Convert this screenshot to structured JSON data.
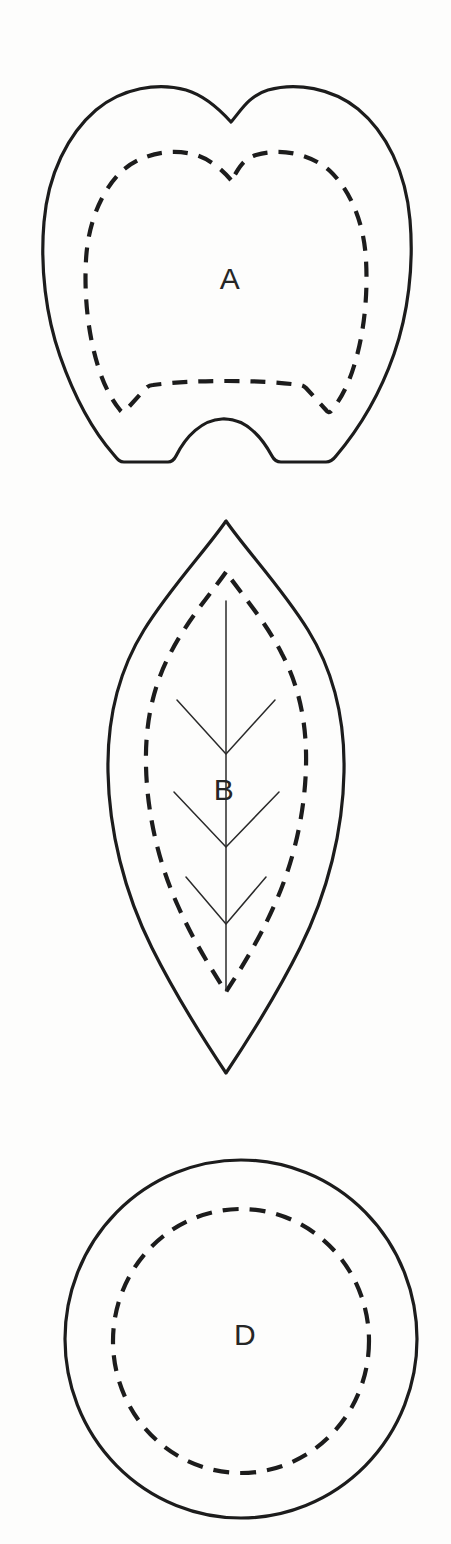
{
  "document": {
    "title": "Botanical outline plate",
    "background_color": "#fdfdfc",
    "ink_color": "#1c1c1c",
    "width": 451,
    "height": 1544
  },
  "figures": [
    {
      "id": "figure-a",
      "label": "A",
      "shape_name": "tooth-outline",
      "description": "Bilobed tooth-like outline with notched apex, flat base interrupted by a central arch, and an inner dashed contour",
      "label_x": 230,
      "label_y": 281,
      "outer_stroke": "solid",
      "inner_stroke": "dashed",
      "bounds": {
        "x": 42,
        "y": 84,
        "width": 378,
        "height": 388
      }
    },
    {
      "id": "figure-b",
      "label": "B",
      "shape_name": "leaf-outline",
      "description": "Lanceolate leaf outline with pointed apex and base, inner dashed contour, central midrib and three pairs of lateral veins",
      "label_x": 224,
      "label_y": 792,
      "outer_stroke": "solid",
      "inner_stroke": "dashed",
      "veins": "midrib-with-three-vein-pairs",
      "bounds": {
        "x": 108,
        "y": 520,
        "width": 232,
        "height": 558
      }
    },
    {
      "id": "figure-d",
      "label": "D",
      "shape_name": "circle-outline",
      "description": "Circular outline with a concentric inner dashed circle",
      "label_x": 245,
      "label_y": 1337,
      "outer_stroke": "solid",
      "inner_stroke": "dashed",
      "bounds": {
        "x": 65,
        "y": 1160,
        "width": 353,
        "height": 358
      }
    }
  ]
}
